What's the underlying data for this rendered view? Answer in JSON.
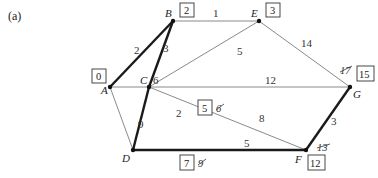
{
  "panel_label": "(a)",
  "nodes": {
    "A": {
      "label": "A",
      "distance": "0"
    },
    "B": {
      "label": "B",
      "distance": "2"
    },
    "C": {
      "label": "C",
      "distance": "5",
      "crossed": "6"
    },
    "D": {
      "label": "D",
      "distance": "7",
      "crossed": "9"
    },
    "E": {
      "label": "E",
      "distance": "3"
    },
    "F": {
      "label": "F",
      "distance": "12",
      "crossed": "13"
    },
    "G": {
      "label": "G",
      "distance": "15",
      "crossed": "17"
    }
  },
  "edges": {
    "AB": {
      "weight": "2",
      "in_tree": true
    },
    "BE": {
      "weight": "1",
      "in_tree": false
    },
    "BC": {
      "weight": "3",
      "in_tree": true
    },
    "EC": {
      "weight": "5",
      "in_tree": false
    },
    "EG": {
      "weight": "14",
      "in_tree": false
    },
    "AC": {
      "weight": "6",
      "in_tree": false
    },
    "CG": {
      "weight": "12",
      "in_tree": false
    },
    "AD": {
      "weight": "9",
      "in_tree": false
    },
    "CD": {
      "weight": "2",
      "in_tree": true
    },
    "CF": {
      "weight": "8",
      "in_tree": false
    },
    "DF": {
      "weight": "5",
      "in_tree": true
    },
    "FG": {
      "weight": "3",
      "in_tree": true
    }
  }
}
